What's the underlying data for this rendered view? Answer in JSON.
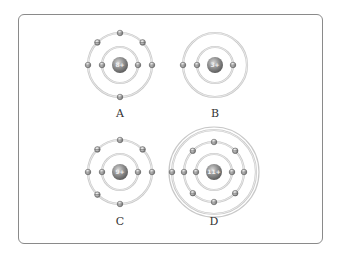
{
  "figure": {
    "atoms": [
      {
        "label": "A",
        "nucleus": "8+",
        "cx": 120,
        "cy": 65,
        "shells": [
          {
            "r": 18,
            "electrons": 2,
            "angles": [
              180,
              0
            ]
          },
          {
            "r": 32,
            "electrons": 6,
            "angles": [
              270,
              225,
              315,
              180,
              0,
              90
            ]
          }
        ]
      },
      {
        "label": "B",
        "nucleus": "3+",
        "cx": 215,
        "cy": 65,
        "shells": [
          {
            "r": 18,
            "electrons": 2,
            "angles": [
              180,
              0
            ]
          },
          {
            "r": 32,
            "electrons": 1,
            "angles": [
              180
            ]
          }
        ]
      },
      {
        "label": "C",
        "nucleus": "9+",
        "cx": 120,
        "cy": 172,
        "shells": [
          {
            "r": 18,
            "electrons": 2,
            "angles": [
              180,
              0
            ]
          },
          {
            "r": 32,
            "electrons": 7,
            "angles": [
              270,
              225,
              315,
              180,
              0,
              135,
              90
            ]
          }
        ]
      },
      {
        "label": "D",
        "nucleus": "11+",
        "cx": 214,
        "cy": 172,
        "shells": [
          {
            "r": 18,
            "electrons": 2,
            "angles": [
              180,
              0
            ]
          },
          {
            "r": 30,
            "electrons": 8,
            "angles": [
              270,
              225,
              315,
              180,
              0,
              135,
              45,
              90
            ]
          },
          {
            "r": 42,
            "electrons": 1,
            "angles": [
              180
            ]
          }
        ]
      }
    ],
    "colors": {
      "frame": "#8a8a8a",
      "orbit": "#c8c8c8",
      "nucleus": "#8c8c8c",
      "electron": "#9a9a9a",
      "label": "#333333"
    }
  }
}
